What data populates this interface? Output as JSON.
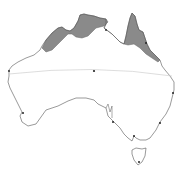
{
  "map": {
    "region": "Australia",
    "colors": {
      "background": "#ffffff",
      "coastline": "#555555",
      "shaded_region": "#8a8a8a",
      "shaded_region_edge": "#666666",
      "arc_line": "#cfcfcf",
      "city_dot": "#222222"
    },
    "shaded_regions": [
      {
        "name": "northern-coast-kimberley-top-end"
      },
      {
        "name": "cape-york-east-queensland-coast"
      }
    ],
    "points": [
      {
        "name": "center-point",
        "x": 94,
        "y": 71
      },
      {
        "name": "west-coast-point",
        "x": 9,
        "y": 71
      },
      {
        "name": "southwest-point",
        "x": 23,
        "y": 113
      },
      {
        "name": "east-coast-point-1",
        "x": 173,
        "y": 93
      },
      {
        "name": "east-coast-point-2",
        "x": 160,
        "y": 123
      },
      {
        "name": "south-point-adelaide",
        "x": 113,
        "y": 122
      },
      {
        "name": "south-point-melbourne",
        "x": 134,
        "y": 136
      },
      {
        "name": "tasmania-point",
        "x": 139,
        "y": 162
      },
      {
        "name": "northeast-point",
        "x": 146,
        "y": 43
      },
      {
        "name": "north-point-darwin",
        "x": 106,
        "y": 30
      }
    ]
  }
}
